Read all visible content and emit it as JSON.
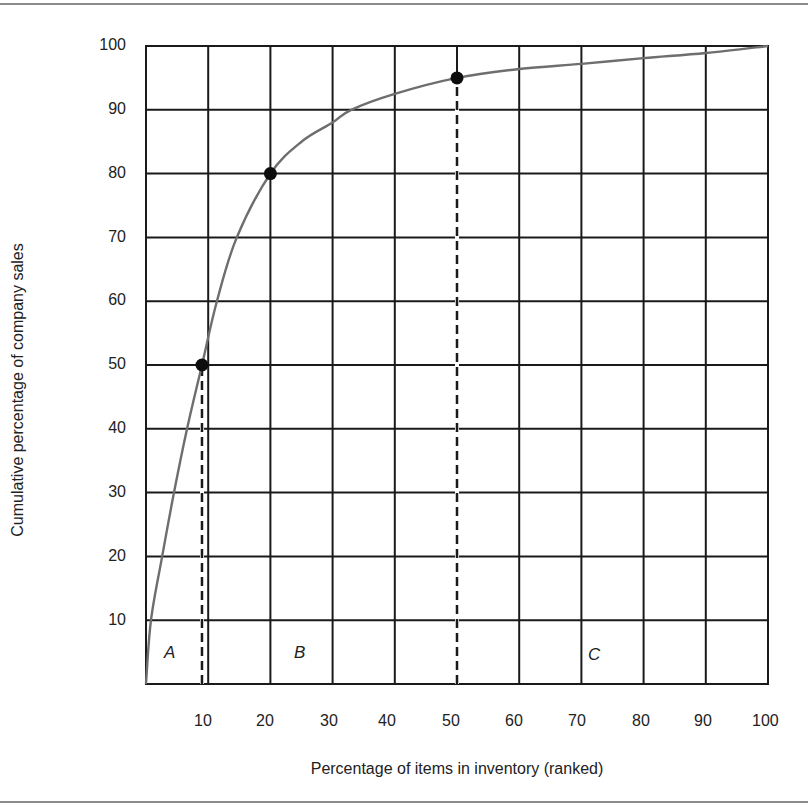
{
  "frame": {
    "top_rule_y": 4,
    "bottom_rule_y": 802
  },
  "plot_box": {
    "left": 146,
    "right": 768,
    "top": 46,
    "bottom": 684
  },
  "colors": {
    "grid": "#1a1a1a",
    "curve": "#6e6e6e",
    "marker": "#0d0d0d",
    "text": "#222222",
    "rule": "#8a8a8a"
  },
  "chart_data": {
    "type": "line",
    "title": "",
    "xlabel": "Percentage of items in inventory (ranked)",
    "ylabel": "Cumulative percentage of company sales",
    "xlim": [
      0,
      100
    ],
    "ylim": [
      0,
      100
    ],
    "x_ticks": [
      10,
      20,
      30,
      40,
      50,
      60,
      70,
      80,
      90,
      100
    ],
    "y_ticks": [
      10,
      20,
      30,
      40,
      50,
      60,
      70,
      80,
      90,
      100
    ],
    "grid": true,
    "legend": null,
    "series": [
      {
        "name": "ABC cumulative sales curve",
        "x": [
          0,
          0.8,
          2.6,
          4.5,
          6.6,
          9,
          11.4,
          14.6,
          20,
          25,
          30,
          33,
          40,
          50,
          60,
          70,
          80,
          90,
          100
        ],
        "y": [
          0,
          10,
          20,
          30,
          40,
          50,
          60,
          70,
          80,
          85,
          88,
          90,
          92.5,
          95,
          96.4,
          97.2,
          98.1,
          98.9,
          100
        ]
      }
    ],
    "markers": [
      {
        "x": 9,
        "y": 50
      },
      {
        "x": 20,
        "y": 80
      },
      {
        "x": 50,
        "y": 95
      }
    ],
    "dashed_lines": [
      {
        "x": 9,
        "y_from": 0,
        "y_to": 50
      },
      {
        "x": 50,
        "y_from": 0,
        "y_to": 95
      }
    ],
    "annotations": [
      {
        "text": "A",
        "x": 4.5,
        "y": 5
      },
      {
        "text": "B",
        "x": 25,
        "y": 5
      },
      {
        "text": "C",
        "x": 72,
        "y": 5
      }
    ]
  },
  "labels": {
    "x_title": "Percentage of items in inventory (ranked)",
    "y_title": "Cumulative percentage of company sales",
    "x_ticks": [
      "10",
      "20",
      "30",
      "40",
      "50",
      "60",
      "70",
      "80",
      "90",
      "100"
    ],
    "y_ticks": [
      "100",
      "90",
      "80",
      "70",
      "60",
      "50",
      "40",
      "30",
      "20",
      "10"
    ],
    "regions": [
      "A",
      "B",
      "C"
    ]
  }
}
